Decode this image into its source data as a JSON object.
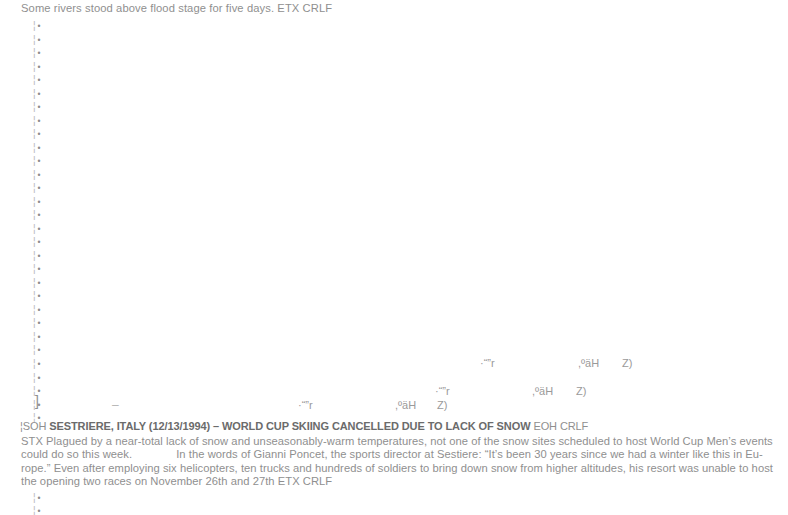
{
  "document": {
    "top_line": "Some rivers stood above flood stage for five days. ETX CRLF",
    "article": {
      "soh_prefix": "¦SOH",
      "headline": "SESTRIERE, ITALY (12/13/1994) – WORLD CUP SKIING CANCELLED DUE TO LACK OF SNOW",
      "eoh_suffix": "EOH CRLF",
      "body_line_1": "STX Plagued by a near-total lack of snow and unseasonably-warm temperatures, not one of the snow sites scheduled to host World Cup Men’s events",
      "body_line_2a": "could do so this week.",
      "body_line_2b": "In the words of Gianni Poncet, the sports director at Sestiere: “It’s been 30 years since we had a winter like this in Eu-",
      "body_line_3": "rope.” Even after employing six helicopters, ten trucks and hundreds of soldiers to bring down snow from higher altitudes, his resort was unable to host",
      "body_line_4": "the opening two races on November 26th and 27th ETX CRLF"
    },
    "margin": {
      "mark_bar": "¦",
      "mark_dot": "•",
      "top_count": 30,
      "top_start_y": 21,
      "top_step_y": 13.52,
      "bottom_count": 2,
      "bottom_start_y": 493,
      "bottom_step_y": 13
    },
    "artifacts": {
      "bracket": "]",
      "dash": "–",
      "fragments": [
        {
          "text": "·“”r",
          "x": 480,
          "y": 357
        },
        {
          "text": ",ºäH",
          "x": 578,
          "y": 357
        },
        {
          "text": "Z)",
          "x": 622,
          "y": 357
        },
        {
          "text": "·“”r",
          "x": 435,
          "y": 385
        },
        {
          "text": ",ºäH",
          "x": 532,
          "y": 385
        },
        {
          "text": "Z)",
          "x": 576,
          "y": 385
        },
        {
          "text": "·“”r",
          "x": 298,
          "y": 399
        },
        {
          "text": ",ºäH",
          "x": 395,
          "y": 399
        },
        {
          "text": "Z)",
          "x": 437,
          "y": 399
        }
      ]
    },
    "colors": {
      "background": "#ffffff",
      "body_text": "#8f8f8f",
      "headline_text": "#6b6b6b",
      "margin_marks": "#9a9a9a"
    }
  }
}
